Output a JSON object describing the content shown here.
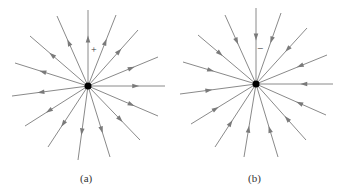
{
  "panels": [
    {
      "id": "a",
      "caption": "(a)",
      "charge_sign": "+",
      "direction": "outward",
      "center": [
        88,
        86
      ],
      "ends": [
        [
          88,
          10
        ],
        [
          116,
          15
        ],
        [
          138,
          30
        ],
        [
          158,
          57
        ],
        [
          165,
          86
        ],
        [
          158,
          116
        ],
        [
          140,
          140
        ],
        [
          110,
          157
        ],
        [
          78,
          160
        ],
        [
          48,
          147
        ],
        [
          25,
          126
        ],
        [
          12,
          96
        ],
        [
          15,
          63
        ],
        [
          30,
          36
        ],
        [
          57,
          16
        ]
      ]
    },
    {
      "id": "b",
      "caption": "(b)",
      "charge_sign": "−",
      "direction": "inward",
      "center": [
        256,
        84
      ],
      "ends": [
        [
          256,
          8
        ],
        [
          281,
          13
        ],
        [
          307,
          28
        ],
        [
          327,
          55
        ],
        [
          333,
          84
        ],
        [
          326,
          115
        ],
        [
          306,
          140
        ],
        [
          278,
          157
        ],
        [
          244,
          157
        ],
        [
          215,
          147
        ],
        [
          191,
          124
        ],
        [
          180,
          94
        ],
        [
          183,
          62
        ],
        [
          198,
          35
        ],
        [
          225,
          15
        ]
      ]
    }
  ],
  "colors": {
    "line": "#8a8a8a",
    "arrow": "#7a7a7a",
    "charge": "#000000"
  }
}
